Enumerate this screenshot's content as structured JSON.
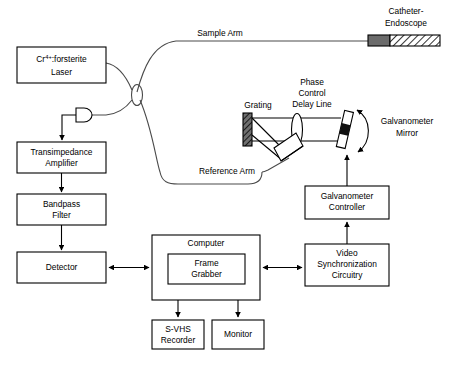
{
  "diagram": {
    "type": "optical-system-block-diagram",
    "colors": {
      "background": "#ffffff",
      "stroke": "#000000",
      "fiber_stroke": "#4a4a4a",
      "grating_fill": "#5a5a5a",
      "catheter_tip_fill": "#6b6b6b",
      "hatch_fill": "#ffffff"
    },
    "blocks": [
      {
        "id": "laser",
        "label_line1": "Cr",
        "label_sup": "4+",
        "label_line1b": ":forsterite",
        "label_line2": "Laser",
        "x": 17,
        "y": 47,
        "w": 89,
        "h": 36
      },
      {
        "id": "transimpedance",
        "label_line1": "Transimpedance",
        "label_line2": "Amplifier",
        "x": 17,
        "y": 142,
        "w": 89,
        "h": 31
      },
      {
        "id": "bandpass",
        "label_line1": "Bandpass",
        "label_line2": "Filter",
        "x": 17,
        "y": 194,
        "w": 89,
        "h": 31
      },
      {
        "id": "detector",
        "label_line1": "Detector",
        "label_line2": "",
        "x": 17,
        "y": 252,
        "w": 89,
        "h": 31
      },
      {
        "id": "computer",
        "label_line1": "Computer",
        "label_line2": "",
        "x": 152,
        "y": 235,
        "w": 108,
        "h": 65
      },
      {
        "id": "framegrabber",
        "label_line1": "Frame",
        "label_line2": "Grabber",
        "x": 168,
        "y": 254,
        "w": 77,
        "h": 30
      },
      {
        "id": "svhs",
        "label_line1": "S-VHS",
        "label_line2": "Recorder",
        "x": 152,
        "y": 320,
        "w": 52,
        "h": 29
      },
      {
        "id": "monitor",
        "label_line1": "Monitor",
        "label_line2": "",
        "x": 212,
        "y": 320,
        "w": 52,
        "h": 29
      },
      {
        "id": "galvocontrol",
        "label_line1": "Galvanometer",
        "label_line2": "Controller",
        "x": 305,
        "y": 186,
        "w": 84,
        "h": 33
      },
      {
        "id": "videosync",
        "label_line1": "Video",
        "label_line2": "Synchronization",
        "label_line3": "Circuitry",
        "x": 305,
        "y": 244,
        "w": 84,
        "h": 42
      }
    ],
    "labels": {
      "sample_arm": "Sample Arm",
      "reference_arm": "Reference Arm",
      "catheter_endoscope_line1": "Catheter-",
      "catheter_endoscope_line2": "Endoscope",
      "grating": "Grating",
      "phase_line1": "Phase",
      "phase_line2": "Control",
      "phase_line3": "Delay Line",
      "galvo_mirror_line1": "Galvanometer",
      "galvo_mirror_line2": "Mirror"
    },
    "components": {
      "fiber_coupler": "fiber-optic-coupler",
      "photodetector": "photodetector-diode",
      "diffraction_grating": "diffraction-grating",
      "lens": "lens",
      "galvanometer_mirror": "galvanometer-mirror",
      "prism": "prism",
      "catheter_tip": "catheter-tip",
      "catheter_sheath": "catheter-sheath"
    }
  }
}
